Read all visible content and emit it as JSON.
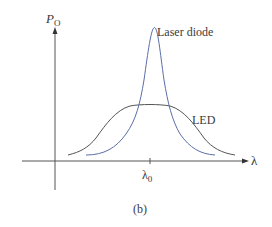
{
  "diagram": {
    "y_axis_label": "P",
    "y_axis_label_sub": "O",
    "x_axis_label": "λ",
    "x_tick_label": "λ",
    "x_tick_label_sub": "0",
    "curves": [
      {
        "name": "Laser diode",
        "label": "Laser diode",
        "color": "#5b6fa8"
      },
      {
        "name": "LED",
        "label": "LED",
        "color": "#555555"
      }
    ],
    "caption": "(b)"
  }
}
